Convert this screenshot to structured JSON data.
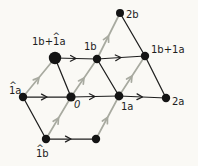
{
  "diagram": {
    "colors": {
      "paper": "#faf9f5",
      "ink": "#1e1e1e",
      "accent_gray": "#a8aaa0",
      "dot": "#141414"
    },
    "stroke": {
      "ink_width": 1.25,
      "accent_width": 1.7
    },
    "points": [
      {
        "id": "2b",
        "x": 120,
        "y": 13,
        "r": 4.0
      },
      {
        "id": "1b-plus-neg1a",
        "x": 55,
        "y": 58,
        "r": 6.2
      },
      {
        "id": "1b",
        "x": 97,
        "y": 59,
        "r": 4.2
      },
      {
        "id": "1b-plus-1a",
        "x": 145,
        "y": 56,
        "r": 4.2
      },
      {
        "id": "neg1a",
        "x": 23,
        "y": 97,
        "r": 4.2
      },
      {
        "id": "origin",
        "x": 71,
        "y": 97,
        "r": 4.6
      },
      {
        "id": "1a",
        "x": 119,
        "y": 96,
        "r": 4.4
      },
      {
        "id": "2a",
        "x": 166,
        "y": 98,
        "r": 4.2
      },
      {
        "id": "neg1b",
        "x": 46,
        "y": 139,
        "r": 4.2
      },
      {
        "id": "1a-minus-1b",
        "x": 96,
        "y": 139,
        "r": 4.2
      }
    ],
    "edges": [
      {
        "from": "neg1a",
        "to": "origin",
        "style": "a"
      },
      {
        "from": "origin",
        "to": "1a",
        "style": "a"
      },
      {
        "from": "1a",
        "to": "2a",
        "style": "a"
      },
      {
        "from": "1b-plus-neg1a",
        "to": "1b",
        "style": "a"
      },
      {
        "from": "1b",
        "to": "1b-plus-1a",
        "style": "a"
      },
      {
        "from": "neg1b",
        "to": "1a-minus-1b",
        "style": "a"
      },
      {
        "from": "neg1a",
        "to": "1b-plus-neg1a",
        "style": "b"
      },
      {
        "from": "origin",
        "to": "1b",
        "style": "b"
      },
      {
        "from": "1a",
        "to": "1b-plus-1a",
        "style": "b"
      },
      {
        "from": "1b",
        "to": "2b",
        "style": "b"
      },
      {
        "from": "neg1b",
        "to": "origin",
        "style": "b"
      },
      {
        "from": "1a-minus-1b",
        "to": "1a",
        "style": "b"
      },
      {
        "from": "neg1a",
        "to": "neg1b",
        "style": "plain"
      },
      {
        "from": "1b-plus-neg1a",
        "to": "origin",
        "style": "plain"
      },
      {
        "from": "1b",
        "to": "1a",
        "style": "plain"
      },
      {
        "from": "2b",
        "to": "1b-plus-1a",
        "style": "plain"
      },
      {
        "from": "1b-plus-1a",
        "to": "2a",
        "style": "plain"
      }
    ],
    "labels": [
      {
        "text": "2b",
        "x": 126,
        "y": 18
      },
      {
        "text": "1b+1a",
        "x": 32,
        "y": 45
      },
      {
        "text": "^",
        "x": 52.5,
        "y": 39,
        "hat": true
      },
      {
        "text": "1b",
        "x": 84,
        "y": 50
      },
      {
        "text": "1b+1a",
        "x": 151,
        "y": 53
      },
      {
        "text": "1a",
        "x": 9,
        "y": 94
      },
      {
        "text": "^",
        "x": 9.2,
        "y": 88,
        "hat": true
      },
      {
        "text": "0",
        "x": 74,
        "y": 108,
        "italic": true
      },
      {
        "text": "1a",
        "x": 121,
        "y": 110
      },
      {
        "text": "2a",
        "x": 172,
        "y": 105
      },
      {
        "text": "1b",
        "x": 36,
        "y": 157
      },
      {
        "text": "^",
        "x": 36.2,
        "y": 151,
        "hat": true
      }
    ]
  }
}
